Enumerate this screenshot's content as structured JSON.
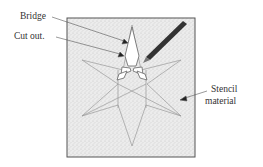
{
  "labels": {
    "bridge": "Bridge",
    "cut_out": "Cut out.",
    "stencil_line1": "Stencil",
    "stencil_line2": "material"
  },
  "colors": {
    "sheet_fill": "#ebebeb",
    "sheet_border": "#555555",
    "star_stroke": "#999999",
    "pencil": "#333333",
    "text": "#333333"
  }
}
